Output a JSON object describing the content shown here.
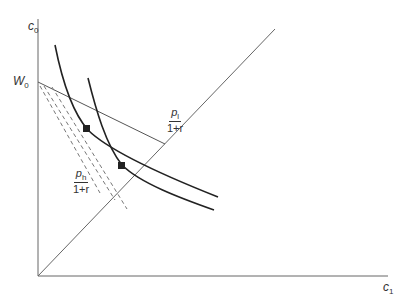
{
  "diagram": {
    "axes": {
      "y_label": "c",
      "y_sub": "0",
      "x_label": "c",
      "x_sub": "1",
      "intercept_label": "W",
      "intercept_sub": "0"
    },
    "budget_lines": [
      {
        "id": "low",
        "num": "p",
        "num_sub": "l",
        "den": "1+r",
        "style": "solid"
      },
      {
        "id": "high",
        "num": "p",
        "num_sub": "h",
        "den": "1+r",
        "style": "dashed"
      }
    ],
    "forty_five_line": "45-degree line",
    "indifference_curves": 2,
    "optimum_markers": 2,
    "colors": {
      "ink": "#333333",
      "thin": "#555555",
      "background": "#ffffff"
    }
  }
}
